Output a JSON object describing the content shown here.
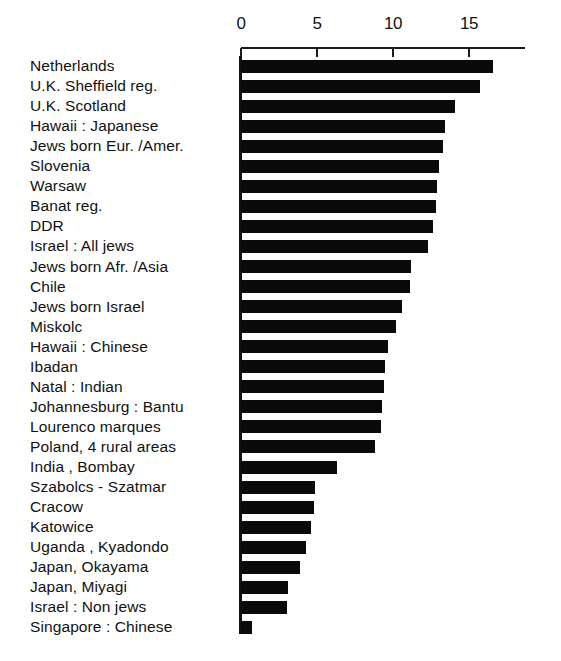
{
  "chart_data": {
    "type": "bar",
    "orientation": "horizontal",
    "title": "",
    "subtitle": "",
    "xlabel": "",
    "ylabel": "",
    "xlim": [
      0,
      18.7
    ],
    "grid": false,
    "legend": false,
    "bar_color": "#0a0a0a",
    "background_color": "#ffffff",
    "axis_position": "top",
    "axis_ticks": [
      {
        "label": "0",
        "value": 0
      },
      {
        "label": "5",
        "value": 5
      },
      {
        "label": "10",
        "value": 10
      },
      {
        "label": "15",
        "value": 15
      }
    ],
    "categories": [
      "Netherlands",
      "U.K. Sheffield  reg.",
      "U.K. Scotland",
      "Hawaii : Japanese",
      "Jews born Eur. /Amer.",
      "Slovenia",
      "Warsaw",
      "Banat reg.",
      "DDR",
      "Israel : All jews",
      "Jews born Afr. /Asia",
      "Chile",
      "Jews born  Israel",
      "Miskolc",
      "Hawaii : Chinese",
      "Ibadan",
      "Natal : Indian",
      "Johannesburg : Bantu",
      "Lourenco marques",
      "Poland, 4 rural areas",
      "India , Bombay",
      "Szabolcs - Szatmar",
      "Cracow",
      "Katowice",
      "Uganda , Kyadondo",
      "Japan, Okayama",
      "Japan, Miyagi",
      "Israel : Non  jews",
      "Singapore : Chinese"
    ],
    "values": [
      16.6,
      15.7,
      14.1,
      13.4,
      13.3,
      13.0,
      12.9,
      12.8,
      12.6,
      12.3,
      11.2,
      11.1,
      10.6,
      10.2,
      9.7,
      9.5,
      9.4,
      9.3,
      9.2,
      8.8,
      6.3,
      4.9,
      4.8,
      4.6,
      4.3,
      3.9,
      3.1,
      3.0,
      0.75
    ]
  }
}
